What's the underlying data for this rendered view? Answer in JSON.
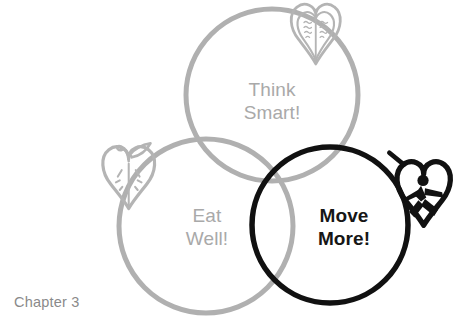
{
  "page": {
    "background_color": "#ffffff",
    "caption": "Chapter 3"
  },
  "palette": {
    "gray_stroke": "#b0b0b0",
    "gray_icon": "#b4b4b4",
    "gray_text": "#a9a9a9",
    "black_stroke": "#111111",
    "black_text": "#161616",
    "caption_gray": "#8a8a8a"
  },
  "diagram": {
    "type": "venn",
    "circle_count": 3,
    "circles": [
      {
        "id": "think-smart",
        "label_line1": "Think",
        "label_line2": "Smart!",
        "color": "#b0b0b0",
        "emphasis": "normal",
        "cx": 272,
        "cy": 95,
        "r": 86,
        "stroke_width": 5,
        "icon": "book-heart-icon"
      },
      {
        "id": "eat-well",
        "label_line1": "Eat",
        "label_line2": "Well!",
        "color": "#b0b0b0",
        "emphasis": "normal",
        "cx": 206,
        "cy": 226,
        "r": 87,
        "stroke_width": 5,
        "icon": "apple-heart-icon"
      },
      {
        "id": "move-more",
        "label_line1": "Move",
        "label_line2": "More!",
        "color": "#111111",
        "emphasis": "bold",
        "cx": 330,
        "cy": 225,
        "r": 78,
        "stroke_width": 5.5,
        "icon": "runner-heart-icon"
      }
    ],
    "icons": [
      {
        "id": "book-heart-icon",
        "name": "book-heart-icon",
        "description": "heart shaped open book with text lines",
        "color": "#b4b4b4",
        "x": 286,
        "y": 2,
        "size": 62
      },
      {
        "id": "apple-heart-icon",
        "name": "apple-heart-icon",
        "description": "heart shaped apple with stem leaf and seeds",
        "color": "#b4b4b4",
        "x": 98,
        "y": 142,
        "size": 64
      },
      {
        "id": "runner-heart-icon",
        "name": "runner-heart-icon",
        "description": "heart outline with running figure inside",
        "color": "#111111",
        "x": 392,
        "y": 158,
        "size": 66
      }
    ],
    "labels": {
      "think_smart": "Think\nSmart!",
      "eat_well": "Eat\nWell!",
      "move_more": "Move\nMore!"
    }
  }
}
